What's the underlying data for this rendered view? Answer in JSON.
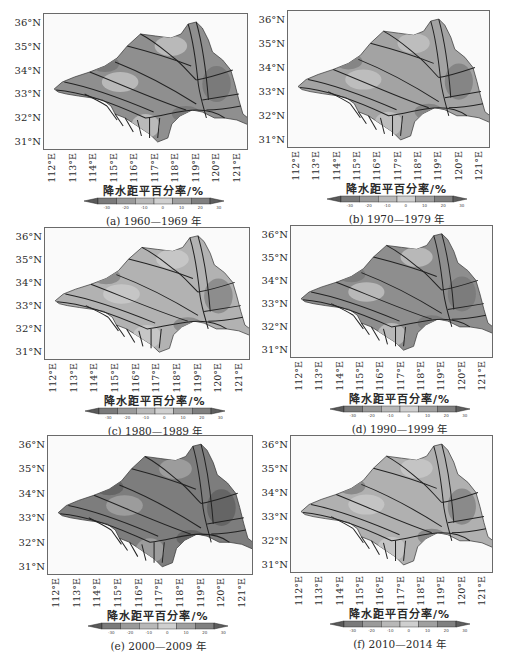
{
  "chart_data": [
    {
      "type": "heatmap",
      "panel": "a",
      "caption": "(a) 1960—1969 年",
      "title": "",
      "xlabel": "",
      "ylabel": "",
      "x_ticks": [
        "112°E",
        "113°E",
        "114°E",
        "115°E",
        "116°E",
        "117°E",
        "118°E",
        "119°E",
        "120°E",
        "121°E"
      ],
      "y_ticks": [
        "36°N",
        "35°N",
        "34°N",
        "33°N",
        "32°N",
        "31°N"
      ],
      "colorbar_label": "降水距平百分率/%",
      "colorbar_ticks": [
        -30,
        -20,
        -10,
        0,
        10,
        20,
        30
      ],
      "dominant_anomaly_pct": 10,
      "description": "Basin-wide mostly positive anomaly (mid-gray), lighter patches in north-central and southern sub-basins"
    },
    {
      "type": "heatmap",
      "panel": "b",
      "caption": "(b) 1970—1979 年",
      "x_ticks": [
        "112°E",
        "113°E",
        "114°E",
        "115°E",
        "116°E",
        "117°E",
        "118°E",
        "119°E",
        "120°E",
        "121°E"
      ],
      "y_ticks": [
        "36°N",
        "35°N",
        "34°N",
        "33°N",
        "32°N",
        "31°N"
      ],
      "colorbar_label": "降水距平百分率/%",
      "colorbar_ticks": [
        -30,
        -20,
        -10,
        0,
        10,
        20,
        30
      ],
      "dominant_anomaly_pct": 0,
      "description": "Mixed near-normal anomalies, darker in the west and southern headwaters"
    },
    {
      "type": "heatmap",
      "panel": "c",
      "caption": "(c) 1980—1989 年",
      "x_ticks": [
        "112°E",
        "113°E",
        "114°E",
        "115°E",
        "116°E",
        "117°E",
        "118°E",
        "119°E",
        "120°E",
        "121°E"
      ],
      "y_ticks": [
        "36°N",
        "35°N",
        "34°N",
        "33°N",
        "32°N",
        "31°N"
      ],
      "colorbar_label": "降水距平百分率/%",
      "colorbar_ticks": [
        -30,
        -20,
        -10,
        0,
        10,
        20,
        30
      ],
      "dominant_anomaly_pct": -5,
      "description": "Predominantly light (negative/near-zero) across central basin, darker band in north and east"
    },
    {
      "type": "heatmap",
      "panel": "d",
      "caption": "(d) 1990—1999 年",
      "x_ticks": [
        "112°E",
        "113°E",
        "114°E",
        "115°E",
        "116°E",
        "117°E",
        "118°E",
        "119°E",
        "120°E",
        "121°E"
      ],
      "y_ticks": [
        "36°N",
        "35°N",
        "34°N",
        "33°N",
        "32°N",
        "31°N"
      ],
      "colorbar_label": "降水距平百分率/%",
      "colorbar_ticks": [
        -30,
        -20,
        -10,
        0,
        10,
        20,
        30
      ],
      "dominant_anomaly_pct": 5,
      "description": "Moderately dark over most of basin, lighter patches in northeast and west-central"
    },
    {
      "type": "heatmap",
      "panel": "e",
      "caption": "(e) 2000—2009 年",
      "x_ticks": [
        "112°E",
        "113°E",
        "114°E",
        "115°E",
        "116°E",
        "117°E",
        "118°E",
        "119°E",
        "120°E",
        "121°E"
      ],
      "y_ticks": [
        "36°N",
        "35°N",
        "34°N",
        "33°N",
        "32°N",
        "31°N"
      ],
      "colorbar_label": "降水距平百分率/%",
      "colorbar_ticks": [
        -30,
        -20,
        -10,
        0,
        10,
        20,
        30
      ],
      "dominant_anomaly_pct": 15,
      "description": "Darkest decade: strong positive anomaly basin-wide, darkest core near 115°E 34.5°N"
    },
    {
      "type": "heatmap",
      "panel": "f",
      "caption": "(f) 2010—2014 年",
      "x_ticks": [
        "112°E",
        "113°E",
        "114°E",
        "115°E",
        "116°E",
        "117°E",
        "118°E",
        "119°E",
        "120°E",
        "121°E"
      ],
      "y_ticks": [
        "36°N",
        "35°N",
        "34°N",
        "33°N",
        "32°N",
        "31°N"
      ],
      "colorbar_label": "降水距平百分率/%",
      "colorbar_ticks": [
        -30,
        -20,
        -10,
        0,
        10,
        20,
        30
      ],
      "dominant_anomaly_pct": -5,
      "description": "Light central basin (negative), darker in north (Yi-Shu-Si) and southwest"
    }
  ],
  "panels": [
    {
      "id": "a",
      "caption": "(a) 1960—1969 年",
      "base": "#8f8f8f",
      "patch": "#b9b9b9",
      "dark": "#7a7a7a"
    },
    {
      "id": "b",
      "caption": "(b) 1970—1979 年",
      "base": "#a3a3a3",
      "patch": "#bdbdbd",
      "dark": "#858585"
    },
    {
      "id": "c",
      "caption": "(c) 1980—1989 年",
      "base": "#b2b2b2",
      "patch": "#c6c6c6",
      "dark": "#8d8d8d"
    },
    {
      "id": "d",
      "caption": "(d) 1990—1999 年",
      "base": "#8e8e8e",
      "patch": "#b8b8b8",
      "dark": "#7c7c7c"
    },
    {
      "id": "e",
      "caption": "(e) 2000—2009 年",
      "base": "#7d7d7d",
      "patch": "#9c9c9c",
      "dark": "#656565"
    },
    {
      "id": "f",
      "caption": "(f) 2010—2014 年",
      "base": "#b0b0b0",
      "patch": "#c4c4c4",
      "dark": "#8a8a8a"
    }
  ],
  "axes": {
    "x_ticks": [
      "112°E",
      "113°E",
      "114°E",
      "115°E",
      "116°E",
      "117°E",
      "118°E",
      "119°E",
      "120°E",
      "121°E"
    ],
    "y_ticks": [
      "36°N",
      "35°N",
      "34°N",
      "33°N",
      "32°N",
      "31°N"
    ]
  },
  "colorbar": {
    "label": "降水距平百分率/%",
    "ticks": [
      "-30",
      "-20",
      "-10",
      "0",
      "10",
      "20",
      "30"
    ],
    "colors": [
      "#5a5a5a",
      "#7a7a7a",
      "#9a9a9a",
      "#b8b8b8",
      "#cfcfcf",
      "#a0a0a0",
      "#808080",
      "#5e5e5e"
    ]
  }
}
